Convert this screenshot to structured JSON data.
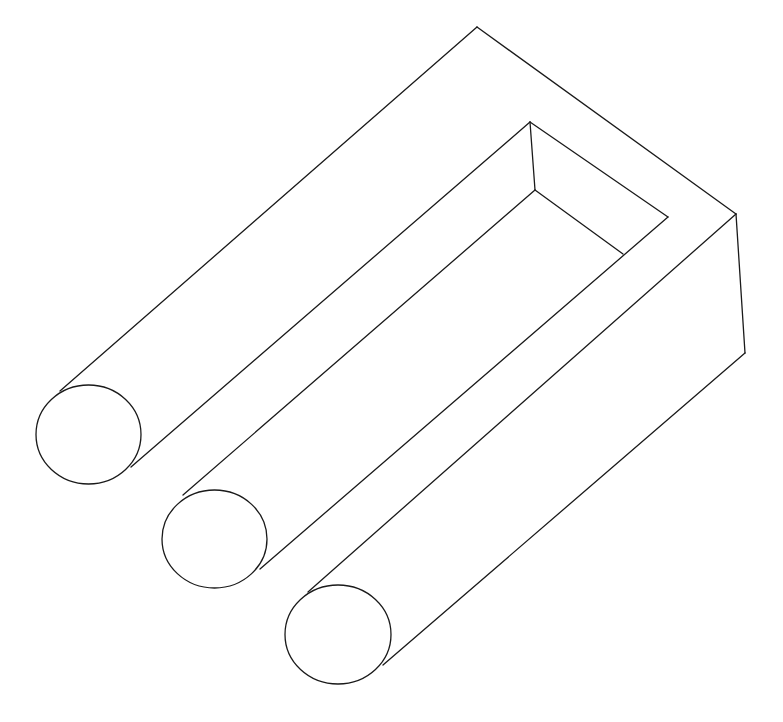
{
  "figure": {
    "background": "#ffffff",
    "stroke": "#1a1a1a",
    "stroke_width": 1.3,
    "edges": [
      {
        "name": "outer-top-left-edge",
        "x1": 477,
        "y1": 27,
        "x2": 60,
        "y2": 391
      },
      {
        "name": "outer-top-right-edge",
        "x1": 477,
        "y1": 27,
        "x2": 736,
        "y2": 214
      },
      {
        "name": "right-vertical-edge",
        "x1": 736,
        "y1": 214,
        "x2": 745,
        "y2": 353
      },
      {
        "name": "bottom-outer-edge",
        "x1": 745,
        "y1": 353,
        "x2": 383,
        "y2": 665
      },
      {
        "name": "front-top-edge-prong3",
        "x1": 736,
        "y1": 214,
        "x2": 308,
        "y2": 592
      },
      {
        "name": "inner-slot-left-edge",
        "x1": 530,
        "y1": 122,
        "x2": 131,
        "y2": 467
      },
      {
        "name": "inner-slot-top-edge",
        "x1": 530,
        "y1": 122,
        "x2": 668,
        "y2": 217
      },
      {
        "name": "inner-slot-vertical-edge",
        "x1": 530,
        "y1": 122,
        "x2": 535,
        "y2": 190
      },
      {
        "name": "inner-slot-bottom-left-edge",
        "x1": 535,
        "y1": 190,
        "x2": 183,
        "y2": 495
      },
      {
        "name": "inner-slot-floor-edge",
        "x1": 535,
        "y1": 190,
        "x2": 623,
        "y2": 254
      },
      {
        "name": "inner-slot-right-edge",
        "x1": 668,
        "y1": 217,
        "x2": 260,
        "y2": 569
      }
    ],
    "prong_ends": [
      {
        "name": "prong-1-end",
        "cx": 88.5,
        "cy": 434.5,
        "rx": 52.5,
        "ry": 49.5,
        "rotate": 0
      },
      {
        "name": "prong-2-end",
        "cx": 214.5,
        "cy": 539,
        "rx": 52.5,
        "ry": 49,
        "rotate": 0
      },
      {
        "name": "prong-3-end",
        "cx": 338,
        "cy": 634.5,
        "rx": 53,
        "ry": 49.5,
        "rotate": 0
      }
    ]
  }
}
